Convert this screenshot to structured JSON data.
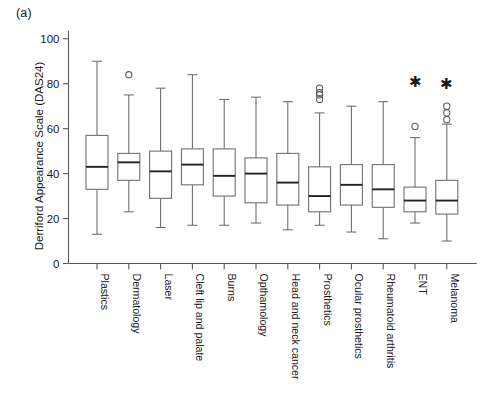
{
  "panel": {
    "label": "(a)"
  },
  "chart_data": {
    "type": "box",
    "title": "",
    "xlabel": "",
    "ylabel": "Derriford Appearance Scale (DAS24)",
    "ylim": [
      0,
      105
    ],
    "yticks": [
      0,
      20,
      40,
      60,
      80,
      100
    ],
    "ytick_labels": [
      "0",
      "20",
      "40",
      "60",
      "80",
      "100"
    ],
    "grid": false,
    "legend": "none",
    "categories": [
      "Plastics",
      "Dermatology",
      "Laser",
      "Cleft lip and palate",
      "Burns",
      "Opthamology",
      "Head and neck cancer",
      "Prosthetics",
      "Ocular prosthetics",
      "Rheumatoid arthritis",
      "ENT",
      "Melanoma"
    ],
    "boxes": [
      {
        "category": "Plastics",
        "whisker_low": 13,
        "q1": 33,
        "median": 43,
        "q3": 57,
        "whisker_high": 90,
        "outliers": [],
        "stars": []
      },
      {
        "category": "Dermatology",
        "whisker_low": 23,
        "q1": 37,
        "median": 45,
        "q3": 49,
        "whisker_high": 75,
        "outliers": [
          84
        ],
        "stars": []
      },
      {
        "category": "Laser",
        "whisker_low": 16,
        "q1": 29,
        "median": 41,
        "q3": 50,
        "whisker_high": 78,
        "outliers": [],
        "stars": []
      },
      {
        "category": "Cleft lip and palate",
        "whisker_low": 17,
        "q1": 35,
        "median": 44,
        "q3": 51,
        "whisker_high": 84,
        "outliers": [],
        "stars": []
      },
      {
        "category": "Burns",
        "whisker_low": 17,
        "q1": 30,
        "median": 39,
        "q3": 51,
        "whisker_high": 73,
        "outliers": [],
        "stars": []
      },
      {
        "category": "Opthamology",
        "whisker_low": 18,
        "q1": 27,
        "median": 40,
        "q3": 47,
        "whisker_high": 74,
        "outliers": [],
        "stars": []
      },
      {
        "category": "Head and neck cancer",
        "whisker_low": 15,
        "q1": 26,
        "median": 36,
        "q3": 49,
        "whisker_high": 72,
        "outliers": [],
        "stars": []
      },
      {
        "category": "Prosthetics",
        "whisker_low": 17,
        "q1": 23,
        "median": 30,
        "q3": 43,
        "whisker_high": 67,
        "outliers": [
          73,
          75,
          76,
          78
        ],
        "stars": []
      },
      {
        "category": "Ocular prosthetics",
        "whisker_low": 14,
        "q1": 26,
        "median": 35,
        "q3": 44,
        "whisker_high": 70,
        "outliers": [],
        "stars": []
      },
      {
        "category": "Rheumatoid arthritis",
        "whisker_low": 11,
        "q1": 25,
        "median": 33,
        "q3": 44,
        "whisker_high": 72,
        "outliers": [],
        "stars": []
      },
      {
        "category": "ENT",
        "whisker_low": 18,
        "q1": 23,
        "median": 28,
        "q3": 34,
        "whisker_high": 56,
        "outliers": [
          61
        ],
        "stars": [
          81
        ]
      },
      {
        "category": "Melanoma",
        "whisker_low": 10,
        "q1": 22,
        "median": 28,
        "q3": 37,
        "whisker_high": 62,
        "outliers": [
          64,
          67,
          70
        ],
        "stars": [
          80
        ]
      }
    ]
  }
}
